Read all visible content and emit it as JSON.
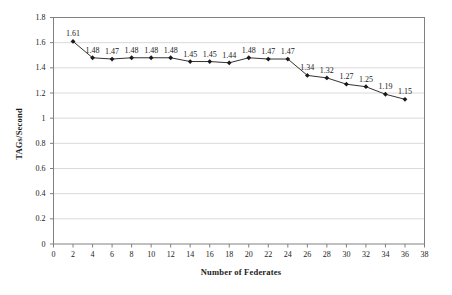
{
  "figure": {
    "background": "#ffffff"
  },
  "chart_data": {
    "type": "line",
    "title": "",
    "xlabel": "Number of Federates",
    "ylabel": "TAGs/Second",
    "x": [
      2,
      4,
      6,
      8,
      10,
      12,
      14,
      16,
      18,
      20,
      22,
      24,
      26,
      28,
      30,
      32,
      34,
      36
    ],
    "values": [
      1.61,
      1.48,
      1.47,
      1.48,
      1.48,
      1.48,
      1.45,
      1.45,
      1.44,
      1.48,
      1.47,
      1.47,
      1.34,
      1.32,
      1.27,
      1.25,
      1.19,
      1.15
    ],
    "point_labels": [
      "1.61",
      "1.48",
      "1.47",
      "1.48",
      "1.48",
      "1.48",
      "1.45",
      "1.45",
      "1.44",
      "1.48",
      "1.47",
      "1.47",
      "1.34",
      "1.32",
      "1.27",
      "1.25",
      "1.19",
      "1.15"
    ],
    "xlim": [
      0,
      38
    ],
    "ylim": [
      0,
      1.8
    ],
    "x_ticks": [
      0,
      2,
      4,
      6,
      8,
      10,
      12,
      14,
      16,
      18,
      20,
      22,
      24,
      26,
      28,
      30,
      32,
      34,
      36,
      38
    ],
    "x_tick_labels": [
      "0",
      "2",
      "4",
      "6",
      "8",
      "10",
      "12",
      "14",
      "16",
      "18",
      "20",
      "22",
      "24",
      "26",
      "28",
      "30",
      "32",
      "34",
      "36",
      "38"
    ],
    "y_ticks": [
      0,
      0.2,
      0.4,
      0.6,
      0.8,
      1,
      1.2,
      1.4,
      1.6,
      1.8
    ],
    "y_tick_labels": [
      "0",
      "0.2",
      "0.4",
      "0.6",
      "0.8",
      "1",
      "1.2",
      "1.4",
      "1.6",
      "1.8"
    ],
    "grid": "horizontal",
    "legend": "none",
    "marker": "diamond",
    "colors": {
      "line": "#333333",
      "marker": "#1a1a1a",
      "gridline": "#dadada",
      "axis": "#808080",
      "text": "#1a1a1a",
      "plot_background": "#ffffff"
    }
  }
}
